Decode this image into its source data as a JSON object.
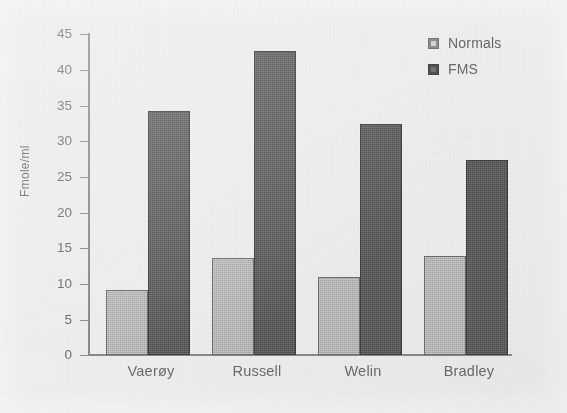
{
  "chart_data": {
    "type": "bar",
    "title": "",
    "subtitle": "",
    "xlabel": "",
    "ylabel": "Fmole/ml",
    "categories": [
      "Vaerøy",
      "Russell",
      "Welin",
      "Bradley"
    ],
    "series": [
      {
        "name": "Normals",
        "color": "#a9a7a5",
        "values": [
          9.1,
          13.5,
          10.9,
          13.9
        ]
      },
      {
        "name": "FMS",
        "color": "#4a4846",
        "values": [
          34.1,
          42.5,
          32.3,
          27.3
        ]
      }
    ],
    "ylim": [
      0,
      45
    ],
    "ytick_labels": [
      "45",
      "40",
      "35",
      "30",
      "25",
      "20",
      "15",
      "10",
      "5",
      "0"
    ],
    "ytick_values": [
      45,
      40,
      35,
      30,
      25,
      20,
      15,
      10,
      5,
      0
    ],
    "grid": false,
    "legend_position": "top-right",
    "legend": [
      "Normals",
      "FMS"
    ],
    "annotations": []
  },
  "legend": {
    "entries": [
      {
        "label": "Normals",
        "swatch": "legend-swatch-normals"
      },
      {
        "label": "FMS",
        "swatch": "legend-swatch-fms"
      }
    ]
  },
  "axes": {
    "y_title": "Fmole/ml",
    "y_ticks": [
      "45",
      "40",
      "35",
      "30",
      "25",
      "20",
      "15",
      "10",
      "5",
      "0"
    ],
    "x_ticks": [
      "Vaerøy",
      "Russell",
      "Welin",
      "Bradley"
    ]
  }
}
